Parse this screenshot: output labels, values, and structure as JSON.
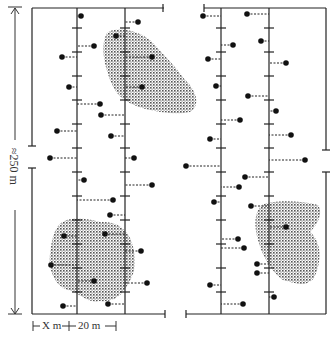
{
  "figure": {
    "type": "field transect sampling diagram",
    "vertical_scale_label": "≈250 m",
    "horizontal_scale": {
      "segment_1_label": "X m",
      "segment_2_label": "20 m",
      "combined_label": "├ X m ┼ 20 m ┤"
    },
    "colors": {
      "lines": "#222222",
      "points": "#111111",
      "shading": "#555555",
      "background": "#ffffff"
    },
    "panels": [
      {
        "id": "left",
        "frame": {
          "x": 32,
          "y": 8,
          "w": 132,
          "h": 136,
          "x2_top": 164
        },
        "transects_x": [
          77,
          125
        ],
        "patches": [
          "top-right near transect 2",
          "bottom-left spanning both transects"
        ]
      },
      {
        "id": "right",
        "frame": {
          "x": 204,
          "y": 8,
          "w": 120
        }
      }
    ]
  },
  "chart_data": {
    "type": "scatter",
    "title": "",
    "xlabel": "X m + 20 m",
    "ylabel": "≈250 m",
    "transects": [
      {
        "panel": "left",
        "x": 77
      },
      {
        "panel": "left",
        "x": 125
      },
      {
        "panel": "right",
        "x": 221
      },
      {
        "panel": "right",
        "x": 269
      }
    ],
    "points": [
      {
        "x": 81,
        "y": 16,
        "t": 77
      },
      {
        "x": 138,
        "y": 22,
        "t": 125
      },
      {
        "x": 94,
        "y": 46,
        "t": 77
      },
      {
        "x": 62,
        "y": 57,
        "t": 77
      },
      {
        "x": 116,
        "y": 36,
        "t": 125
      },
      {
        "x": 152,
        "y": 57,
        "t": 125
      },
      {
        "x": 69,
        "y": 87,
        "t": 77
      },
      {
        "x": 142,
        "y": 87,
        "t": 125
      },
      {
        "x": 100,
        "y": 104,
        "t": 77
      },
      {
        "x": 101,
        "y": 115,
        "t": 125
      },
      {
        "x": 57,
        "y": 131,
        "t": 77
      },
      {
        "x": 111,
        "y": 136,
        "t": 125
      },
      {
        "x": 50,
        "y": 158,
        "t": 77
      },
      {
        "x": 134,
        "y": 158,
        "t": 125
      },
      {
        "x": 84,
        "y": 180,
        "t": 77
      },
      {
        "x": 152,
        "y": 185,
        "t": 125
      },
      {
        "x": 113,
        "y": 200,
        "t": 77
      },
      {
        "x": 110,
        "y": 215,
        "t": 125
      },
      {
        "x": 64,
        "y": 236,
        "t": 77
      },
      {
        "x": 105,
        "y": 234,
        "t": 125
      },
      {
        "x": 141,
        "y": 251,
        "t": 125
      },
      {
        "x": 51,
        "y": 265,
        "t": 77
      },
      {
        "x": 94,
        "y": 281,
        "t": 77
      },
      {
        "x": 147,
        "y": 283,
        "t": 125
      },
      {
        "x": 63,
        "y": 306,
        "t": 77
      },
      {
        "x": 108,
        "y": 304,
        "t": 125
      },
      {
        "x": 203,
        "y": 16,
        "t": 221
      },
      {
        "x": 247,
        "y": 14,
        "t": 269
      },
      {
        "x": 233,
        "y": 45,
        "t": 221
      },
      {
        "x": 261,
        "y": 41,
        "t": 269
      },
      {
        "x": 208,
        "y": 59,
        "t": 221
      },
      {
        "x": 286,
        "y": 63,
        "t": 269
      },
      {
        "x": 216,
        "y": 86,
        "t": 221
      },
      {
        "x": 248,
        "y": 96,
        "t": 269
      },
      {
        "x": 240,
        "y": 120,
        "t": 221
      },
      {
        "x": 276,
        "y": 111,
        "t": 269
      },
      {
        "x": 210,
        "y": 139,
        "t": 221
      },
      {
        "x": 291,
        "y": 135,
        "t": 269
      },
      {
        "x": 186,
        "y": 166,
        "t": 221
      },
      {
        "x": 305,
        "y": 160,
        "t": 269
      },
      {
        "x": 245,
        "y": 177,
        "t": 269
      },
      {
        "x": 239,
        "y": 187,
        "t": 221
      },
      {
        "x": 214,
        "y": 202,
        "t": 221
      },
      {
        "x": 251,
        "y": 206,
        "t": 269
      },
      {
        "x": 286,
        "y": 227,
        "t": 269
      },
      {
        "x": 238,
        "y": 239,
        "t": 221
      },
      {
        "x": 244,
        "y": 248,
        "t": 221
      },
      {
        "x": 257,
        "y": 264,
        "t": 269
      },
      {
        "x": 257,
        "y": 273,
        "t": 269
      },
      {
        "x": 210,
        "y": 285,
        "t": 221
      },
      {
        "x": 274,
        "y": 297,
        "t": 269
      },
      {
        "x": 243,
        "y": 304,
        "t": 221
      }
    ],
    "legend": [],
    "grid": false
  }
}
